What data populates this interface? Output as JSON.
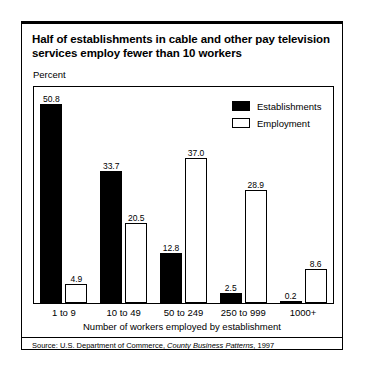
{
  "figure": {
    "title": "Half of establishments in cable and other pay television services employ fewer than 10 workers",
    "axis_unit": "Percent",
    "xlabel": "Number of workers employed by establishment",
    "source_prefix": "Source: U.S. Department of Commerce, ",
    "source_italic": "County Business Patterns",
    "source_suffix": ", 1997"
  },
  "legend": {
    "items": [
      {
        "label": "Establishments",
        "swatch": "filled",
        "color": "#000000"
      },
      {
        "label": "Employment",
        "swatch": "open",
        "color": "#ffffff"
      }
    ]
  },
  "chart_data": {
    "type": "bar",
    "title": "Half of establishments in cable and other pay television services employ fewer than 10 workers",
    "xlabel": "Number of workers employed by establishment",
    "ylabel": "Percent",
    "ylim": [
      0,
      55
    ],
    "grid": false,
    "legend_position": "top-right",
    "categories": [
      "1 to 9",
      "10 to 49",
      "50 to 249",
      "250 to 999",
      "1000+"
    ],
    "series": [
      {
        "name": "Establishments",
        "values": [
          50.8,
          33.7,
          12.8,
          2.5,
          0.2
        ]
      },
      {
        "name": "Employment",
        "values": [
          4.9,
          20.5,
          37.0,
          28.9,
          8.6
        ]
      }
    ]
  }
}
